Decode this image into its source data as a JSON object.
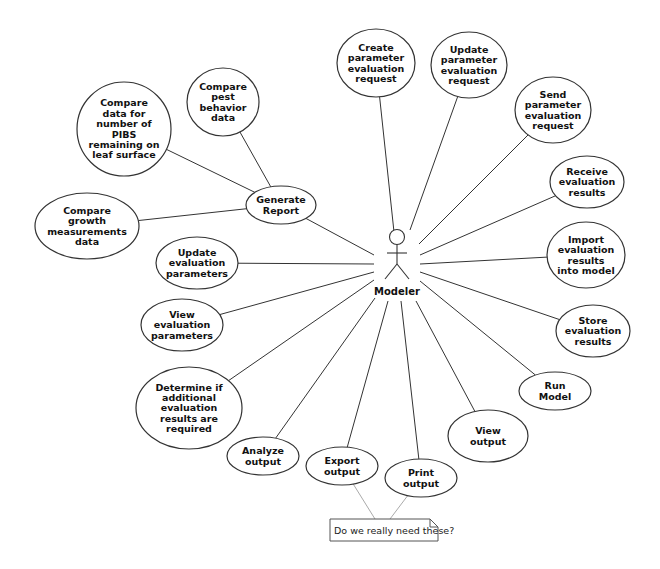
{
  "diagram": {
    "type": "use-case",
    "actor": {
      "name": "Modeler",
      "x": 397,
      "y": 237
    },
    "use_cases": [
      {
        "id": "create-param-req",
        "lines": [
          "Create",
          "parameter",
          "evaluation",
          "request"
        ],
        "cx": 376,
        "cy": 63,
        "rx": 39,
        "ry": 34,
        "link": [
          394,
          232
        ]
      },
      {
        "id": "update-param-req",
        "lines": [
          "Update",
          "parameter",
          "evaluation",
          "request"
        ],
        "cx": 469,
        "cy": 65,
        "rx": 38,
        "ry": 33,
        "link": [
          410,
          230
        ]
      },
      {
        "id": "send-param-req",
        "lines": [
          "Send",
          "parameter",
          "evaluation",
          "request"
        ],
        "cx": 553,
        "cy": 110,
        "rx": 38,
        "ry": 33,
        "link": [
          419,
          244
        ]
      },
      {
        "id": "receive-eval-results",
        "lines": [
          "Receive",
          "evaluation",
          "results"
        ],
        "cx": 587,
        "cy": 182,
        "rx": 37,
        "ry": 26,
        "link": [
          420,
          255
        ]
      },
      {
        "id": "import-eval-results",
        "lines": [
          "Import",
          "evaluation",
          "results",
          "into model"
        ],
        "cx": 586,
        "cy": 255,
        "rx": 39,
        "ry": 33,
        "link": [
          420,
          264
        ]
      },
      {
        "id": "store-eval-results",
        "lines": [
          "Store",
          "evaluation",
          "results"
        ],
        "cx": 593,
        "cy": 331,
        "rx": 37,
        "ry": 26,
        "link": [
          420,
          272
        ]
      },
      {
        "id": "run-model",
        "lines": [
          "Run",
          "Model"
        ],
        "cx": 555,
        "cy": 391,
        "rx": 36,
        "ry": 19,
        "link": [
          420,
          281
        ]
      },
      {
        "id": "view-output",
        "lines": [
          "View",
          "output"
        ],
        "cx": 488,
        "cy": 436,
        "rx": 40,
        "ry": 26,
        "link": [
          416,
          301
        ]
      },
      {
        "id": "print-output",
        "lines": [
          "Print",
          "output"
        ],
        "cx": 421,
        "cy": 478,
        "rx": 36,
        "ry": 19,
        "link": [
          401,
          301
        ]
      },
      {
        "id": "export-output",
        "lines": [
          "Export",
          "output"
        ],
        "cx": 342,
        "cy": 466,
        "rx": 36,
        "ry": 19,
        "link": [
          388,
          301
        ]
      },
      {
        "id": "analyze-output",
        "lines": [
          "Analyze",
          "output"
        ],
        "cx": 263,
        "cy": 456,
        "rx": 36,
        "ry": 19,
        "link": [
          375,
          298
        ]
      },
      {
        "id": "determine-additional",
        "lines": [
          "Determine if",
          "additional",
          "evaluation",
          "results are",
          "required"
        ],
        "cx": 189,
        "cy": 408,
        "rx": 53,
        "ry": 41,
        "link": [
          374,
          280
        ]
      },
      {
        "id": "view-eval-params",
        "lines": [
          "View",
          "evaluation",
          "parameters"
        ],
        "cx": 182,
        "cy": 325,
        "rx": 41,
        "ry": 26,
        "link": [
          374,
          272
        ]
      },
      {
        "id": "update-eval-params",
        "lines": [
          "Update",
          "evaluation",
          "parameters"
        ],
        "cx": 197,
        "cy": 263,
        "rx": 41,
        "ry": 26,
        "link": [
          374,
          264
        ]
      },
      {
        "id": "generate-report",
        "lines": [
          "Generate",
          "Report"
        ],
        "cx": 281,
        "cy": 205,
        "rx": 35,
        "ry": 19,
        "link": [
          374,
          255
        ]
      },
      {
        "id": "compare-growth",
        "lines": [
          "Compare",
          "growth",
          "measurements",
          "data"
        ],
        "cx": 87,
        "cy": 226,
        "rx": 52,
        "ry": 33,
        "link": [
          247,
          209
        ]
      },
      {
        "id": "compare-pibs",
        "lines": [
          "Compare",
          "data for",
          "number of",
          "PIBS",
          "remaining on",
          "leaf surface"
        ],
        "cx": 124,
        "cy": 129,
        "rx": 47,
        "ry": 47,
        "link": [
          247,
          188
        ]
      },
      {
        "id": "compare-pest",
        "lines": [
          "Compare",
          "pest",
          "behavior",
          "data"
        ],
        "cx": 223,
        "cy": 102,
        "rx": 36,
        "ry": 34,
        "link": [
          271,
          187
        ]
      }
    ],
    "note": {
      "text": "Do we really need these?",
      "x": 330,
      "y": 519,
      "w": 108,
      "h": 22,
      "links_to": [
        "export-output",
        "print-output"
      ]
    }
  }
}
